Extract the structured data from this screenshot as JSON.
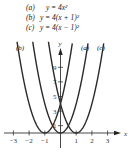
{
  "chart_data": {
    "type": "line",
    "title": "",
    "xlabel": "x",
    "ylabel": "y",
    "xlim": [
      -3.5,
      3.5
    ],
    "ylim": [
      0,
      11
    ],
    "x_ticks": [
      "-3",
      "-2",
      "-1",
      "1",
      "2",
      "3"
    ],
    "y_ticks": [
      "1",
      "3",
      "5",
      "7",
      "9"
    ],
    "grid": false,
    "legend_position": "top",
    "series": [
      {
        "name": "(a)",
        "label": "(a)",
        "equation": "y = 4x²",
        "shift": 0
      },
      {
        "name": "(b)",
        "label": "(b)",
        "equation": "y = 4(x + 1)²",
        "shift": -1
      },
      {
        "name": "(c)",
        "label": "(c)",
        "equation": "y = 4(x − 1)²",
        "shift": 1
      }
    ]
  },
  "legend": [
    {
      "label": "(a)",
      "equation": "y = 4x²"
    },
    {
      "label": "(b)",
      "equation": "y = 4(x + 1)²"
    },
    {
      "label": "(c)",
      "equation": "y = 4(x − 1)²"
    }
  ],
  "axes": {
    "x_label": "x",
    "y_label": "y"
  },
  "curve_labels": {
    "a": "(a)",
    "b": "(b)",
    "c": "(c)"
  }
}
